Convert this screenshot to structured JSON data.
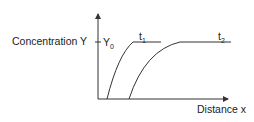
{
  "diagram": {
    "y_axis_label": "Concentration Y",
    "x_axis_label": "Distance x",
    "y_level_label": "Y",
    "y_level_sub": "0",
    "curves": [
      {
        "label": "t",
        "sub": "1"
      },
      {
        "label": "t",
        "sub": "2"
      }
    ],
    "colors": {
      "line": "#333333",
      "text": "#222222"
    }
  }
}
